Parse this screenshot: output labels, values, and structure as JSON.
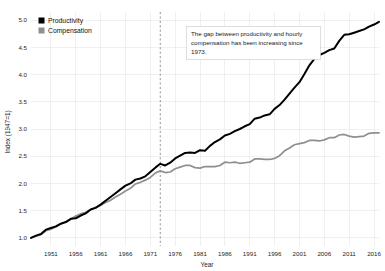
{
  "chart_data": {
    "type": "line",
    "title": "",
    "xlabel": "Year",
    "ylabel": "Index (1947=1)",
    "xlim": [
      1947,
      2017
    ],
    "ylim": [
      0.85,
      5.15
    ],
    "grid": true,
    "legend_position": "top-left",
    "xticks": [
      1951,
      1956,
      1961,
      1966,
      1971,
      1976,
      1981,
      1986,
      1991,
      1996,
      2001,
      2006,
      2011,
      2016
    ],
    "yticks": [
      "1.0",
      "1.5",
      "2.0",
      "2.5",
      "3.0",
      "3.5",
      "4.0",
      "4.5",
      "5.0"
    ],
    "ytick_values": [
      1.0,
      1.5,
      2.0,
      2.5,
      3.0,
      3.5,
      4.0,
      4.5,
      5.0
    ],
    "annotations": [
      {
        "name": "gap-annotation",
        "text": "The gap between productivity and hourly compensation has been increasing since 1973.",
        "x": 1973,
        "y": 4.55
      }
    ],
    "event_lines": [
      {
        "name": "year-1973-marker",
        "x": 1973,
        "style": "dashed",
        "color": "#7a7a7a"
      }
    ],
    "x": [
      1947,
      1948,
      1949,
      1950,
      1951,
      1952,
      1953,
      1954,
      1955,
      1956,
      1957,
      1958,
      1959,
      1960,
      1961,
      1962,
      1963,
      1964,
      1965,
      1966,
      1967,
      1968,
      1969,
      1970,
      1971,
      1972,
      1973,
      1974,
      1975,
      1976,
      1977,
      1978,
      1979,
      1980,
      1981,
      1982,
      1983,
      1984,
      1985,
      1986,
      1987,
      1988,
      1989,
      1990,
      1991,
      1992,
      1993,
      1994,
      1995,
      1996,
      1997,
      1998,
      1999,
      2000,
      2001,
      2002,
      2003,
      2004,
      2005,
      2006,
      2007,
      2008,
      2009,
      2010,
      2011,
      2012,
      2013,
      2014,
      2015,
      2016,
      2017
    ],
    "series": [
      {
        "name": "Productivity",
        "color": "#000000",
        "values": [
          1.0,
          1.04,
          1.07,
          1.15,
          1.18,
          1.21,
          1.26,
          1.29,
          1.35,
          1.36,
          1.41,
          1.45,
          1.52,
          1.55,
          1.61,
          1.68,
          1.75,
          1.82,
          1.89,
          1.96,
          2.0,
          2.07,
          2.09,
          2.13,
          2.21,
          2.29,
          2.36,
          2.33,
          2.38,
          2.46,
          2.51,
          2.56,
          2.57,
          2.56,
          2.61,
          2.6,
          2.69,
          2.76,
          2.81,
          2.88,
          2.91,
          2.96,
          3.0,
          3.05,
          3.09,
          3.19,
          3.21,
          3.25,
          3.27,
          3.37,
          3.44,
          3.54,
          3.65,
          3.76,
          3.86,
          4.01,
          4.17,
          4.29,
          4.36,
          4.4,
          4.45,
          4.48,
          4.62,
          4.73,
          4.74,
          4.77,
          4.8,
          4.83,
          4.88,
          4.92,
          4.97
        ]
      },
      {
        "name": "Compensation",
        "color": "#8f8f8f",
        "values": [
          1.0,
          1.03,
          1.06,
          1.13,
          1.16,
          1.2,
          1.26,
          1.29,
          1.34,
          1.4,
          1.44,
          1.47,
          1.52,
          1.56,
          1.6,
          1.65,
          1.69,
          1.75,
          1.8,
          1.86,
          1.91,
          1.99,
          2.02,
          2.06,
          2.11,
          2.19,
          2.23,
          2.2,
          2.21,
          2.27,
          2.3,
          2.33,
          2.33,
          2.29,
          2.28,
          2.31,
          2.31,
          2.31,
          2.33,
          2.39,
          2.38,
          2.39,
          2.37,
          2.38,
          2.39,
          2.45,
          2.45,
          2.44,
          2.44,
          2.46,
          2.51,
          2.6,
          2.65,
          2.71,
          2.73,
          2.75,
          2.79,
          2.79,
          2.78,
          2.8,
          2.84,
          2.84,
          2.89,
          2.9,
          2.87,
          2.85,
          2.86,
          2.87,
          2.92,
          2.93,
          2.93
        ]
      }
    ]
  },
  "legend": {
    "items": [
      {
        "label": "Productivity",
        "color": "#000000",
        "swatch": "square-swatch"
      },
      {
        "label": "Compensation",
        "color": "#8f8f8f",
        "swatch": "square-swatch"
      }
    ]
  },
  "axes": {
    "x_title": "Year",
    "y_title": "Index (1947=1)"
  },
  "annotation": {
    "line1": "The gap between productivity and hourly",
    "line2": "compensation has been increasing since",
    "line3": "1973."
  }
}
